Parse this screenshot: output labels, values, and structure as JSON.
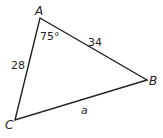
{
  "diagram": {
    "type": "triangle",
    "stroke_color": "#231f20",
    "vertices": {
      "A": {
        "label": "A",
        "x": 40,
        "y": 18
      },
      "B": {
        "label": "B",
        "x": 147,
        "y": 80
      },
      "C": {
        "label": "C",
        "x": 15,
        "y": 120
      }
    },
    "angle_A": "75°",
    "side_AB": "34",
    "side_AC": "28",
    "side_BC": "a"
  }
}
